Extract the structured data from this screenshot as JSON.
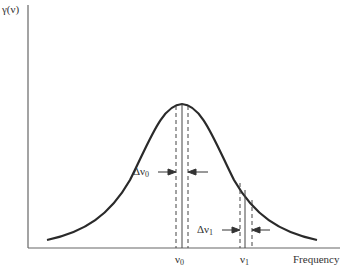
{
  "diagram": {
    "type": "lineshape",
    "y_axis_label": "γ(ν)",
    "x_axis_label": "Frequency",
    "curve": "bell-shaped (Gaussian-like) line profile",
    "markers": [
      {
        "symbol": "ν",
        "subscript": "0",
        "position": "line center (peak)"
      },
      {
        "symbol": "ν",
        "subscript": "1",
        "position": "on right wing"
      }
    ],
    "intervals": [
      {
        "symbol": "Δν",
        "subscript": "0",
        "around": "ν0"
      },
      {
        "symbol": "Δν",
        "subscript": "1",
        "around": "ν1"
      }
    ],
    "colors": {
      "line": "#2a2a2a",
      "axis": "#555555",
      "background": "#ffffff"
    }
  }
}
